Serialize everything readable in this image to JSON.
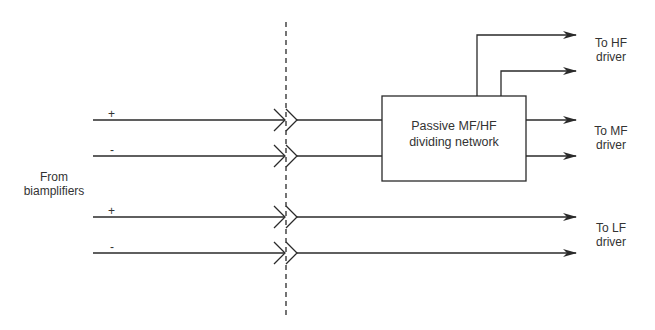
{
  "diagram": {
    "title": "",
    "source_label": {
      "line1": "From",
      "line2": "biamplifiers"
    },
    "signs": [
      "+",
      "-",
      "+",
      "-"
    ],
    "box": {
      "line1": "Passive MF/HF",
      "line2": "dividing network"
    },
    "outputs": {
      "hf": {
        "line1": "To HF",
        "line2": "driver"
      },
      "mf": {
        "line1": "To MF",
        "line2": "driver"
      },
      "lf": {
        "line1": "To LF",
        "line2": "driver"
      }
    },
    "colors": {
      "line": "#2a2a2a",
      "text": "#333333",
      "background": "#ffffff"
    }
  }
}
